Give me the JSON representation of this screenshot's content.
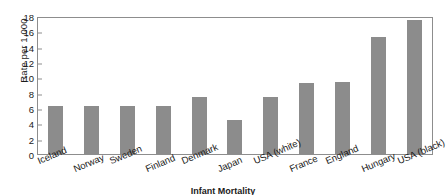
{
  "chart_data": {
    "type": "bar",
    "title": "Infant Mortality",
    "xlabel": "",
    "ylabel": "Rate per 1,000",
    "ylim": [
      0,
      18
    ],
    "ytick_step": 2,
    "yticks": [
      18,
      16,
      14,
      12,
      10,
      8,
      6,
      4,
      2,
      0
    ],
    "grid": false,
    "legend": "none",
    "bar_color": "#8c8c8c",
    "axis_color": "#8d8d8d",
    "categories": [
      "Iceland",
      "Norway",
      "Sweden",
      "Finland",
      "Denmark",
      "Japan",
      "USA (white)",
      "France",
      "England",
      "Hungary",
      "USA (black)"
    ],
    "values": [
      6.3,
      6.3,
      6.3,
      6.3,
      7.5,
      4.4,
      7.5,
      9.3,
      9.4,
      15.2,
      17.5
    ]
  }
}
